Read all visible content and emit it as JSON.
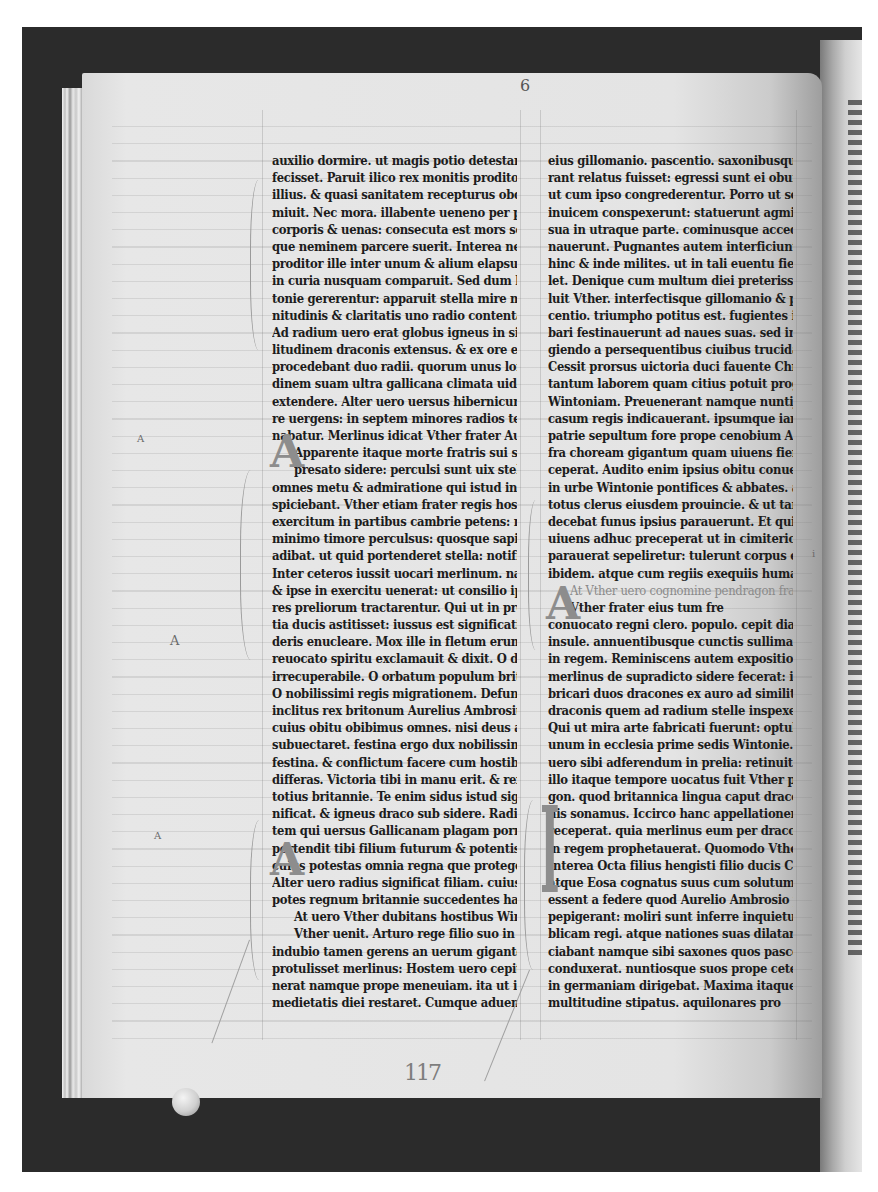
{
  "document": {
    "type": "manuscript-page-photograph",
    "folio_mark": "6",
    "pencil_foliation": "117",
    "colors": {
      "frame": "#2b2b2b",
      "parchment": "#e4e4e4",
      "ink": "#1c1c1c",
      "rubric": "#8a8a8a"
    }
  },
  "left_column": {
    "lines": [
      "auxilio dormire. ut magis potio detestanda pro",
      "fecisset. Paruit ilico rex monitis proditoris",
      "illius. & quasi sanitatem recepturus obdor",
      "miuit. Nec mora. illabente ueneno per poros",
      "corporis & uenas: consecuta est mors soporem",
      "que neminem parcere suerit. Interea nefandus",
      "proditor ille inter unum & alium elapsus",
      "in curia nusquam comparuit. Sed dum hec Win",
      "tonie gererentur: apparuit stella mire mag",
      "nitudinis & claritatis uno radio contenta.",
      "Ad radium uero erat globus igneus in simi",
      "litudinem draconis extensus. & ex ore eius",
      "procedebant duo radii. quorum unus longitu",
      "dinem suam ultra gallicana climata uidebatur",
      "extendere. Alter uero uersus hibernicum ma",
      "re uergens: in septem minores radios termi",
      "nabatur. Merlinus idicat  Vther frater Aurelij de",
      "Apparente itaque  morte fratris sui significata",
      "presato sidere: perculsi sunt  uix stellam appa",
      "omnes metu & admiratione qui istud in",
      "spiciebant. Vther etiam frater regis hostilem",
      "exercitum in partibus cambrie petens: non",
      "minimo timore perculsus: quosque sapientes",
      "adibat. ut quid portenderet stella: notificarent.",
      "Inter ceteros iussit uocari merlinum. nam",
      "& ipse in exercitu uenerat: ut consilio ipsius",
      "res preliorum tractarentur. Qui ut in presen",
      "tia ducis astitisset: iussus est significationem si",
      "deris enucleare. Mox ille in fletum erumpens.",
      "reuocato spiritu exclamauit & dixit. O dampnum",
      "irrecuperabile. O orbatum populum britannie.",
      "O nobilissimi regis migrationem. Defunctus est",
      "inclitus rex britonum Aurelius Ambrosius.",
      "cuius obitu obibimus omnes. nisi deus auxilium",
      "subuectaret. festina ergo dux nobilissime Vther",
      "festina. & conflictum facere cum hostibus ne",
      "differas. Victoria tibi in manu erit. & rex eris",
      "totius britannie. Te enim sidus istud sig",
      "nificat. & igneus draco sub sidere. Radius au",
      "tem qui uersus Gallicanam plagam porrigitur.",
      "portendit tibi filium futurum & potentissimum.",
      "cuius potestas omnia regna que proteget habebit.",
      "Alter uero radius significat filiam. cuius filij & ne",
      "potes regnum britannie succedentes habebunt.",
      "At uero Vther dubitans hostibus  Wintoniam",
      "Vther  uenit. Arturo rege filio suo in cessa",
      "indubio tamen gerens an uerum giganteos iam se",
      "protulisset merlinus: Hostem uero cepit gladio. Adue pal",
      "nerat namque prope meneuiam. ita ut iter to",
      "medietatis diei restaret. Cumque aduentus"
    ]
  },
  "right_column": {
    "lines": [
      "eius gillomanio. pascentio. saxonibusque qui ade",
      "rant relatus fuisset: egressi sunt ei obuiam.",
      "ut cum ipso congrederentur. Porro ut sese ad",
      "inuicem conspexerunt: statuerunt agmina",
      "sua in utraque parte. cominusque accedentes pug",
      "nauerunt. Pugnantes autem interficiuntur",
      "hinc & inde milites. ut in tali euentu fieri so",
      "let. Denique cum multum diei preterisset: pia",
      "luit Vther. interfectisque gillomanio & pas",
      "centio. triumpho potitus est. fugientes itaque bar",
      "bari festinauerunt ad naues suas. sed in fu",
      "giendo a persequentibus ciuibus trucidabantur.",
      "Cessit prorsus uictoria duci fauente Christo. qui post",
      "tantum laborem quam citius potuit progressus est",
      "Wintoniam. Preuenerant namque nuntij qui",
      "casum regis indicauerant. ipsumque iam ab epis",
      "patrie sepultum fore prope cenobium Ambrij in",
      "fra choream gigantum quam uiuens fieri pre",
      "ceperat. Audito enim ipsius obitu conuenerunt",
      "in urbe Wintonie pontifices & abbates. atque",
      "totus clerus eiusdem prouincie. & ut tantum regem",
      "decebat funus ipsius parauerunt. Et quia in",
      "uiuens adhuc preceperat ut in cimiterio quod ipse",
      "parauerat sepeliretur: tulerunt corpus eius",
      "ibidem. atque cum regiis exequiis humauerunt.",
      "At Vther uero cognomine pendragon fra",
      "Vther frater eius  tum fre",
      "conuocato regni clero. populo. cepit diadema",
      "insule. annuentibusque cunctis sullimatus est",
      "in regem. Reminiscens autem expositionis quam",
      "merlinus de supradicto sidere fecerat: iussit fa",
      "bricari duos dracones ex auro ad similitudinem",
      "draconis quem ad radium stelle inspexerat.",
      "Qui ut mira arte fabricati fuerunt: optulit",
      "unum in ecclesia prime sedis Wintonie. alterum",
      "uero sibi adferendum in prelia: retinuit. Ab",
      "illo itaque tempore uocatus fuit Vther pendra",
      "gon. quod britannica lingua caput draco",
      "nis sonamus. Iccirco hanc appellationem",
      "receperat. quia merlinus eum per draconem",
      "in regem prophetauerat. Quomodo Vther pendrago",
      "Interea Octa filius hengisti  filio ducis Cornubie",
      "atque Eosa cognatus suus cum solutum filio hengisti",
      "essent a federe quod Aurelio Ambrosio pepigerant",
      "pepigerant: moliri sunt inferre inquietudinem repu",
      "blicam regi. atque nationes suas dilatare. Asso",
      "ciabant namque sibi saxones quos pascentius",
      "conduxerat. nuntiosque suos prope ceteros",
      "in germaniam dirigebat. Maxima itaque",
      "multitudine stipatus. aquilonares pro"
    ]
  },
  "margin_notes": {
    "left": [
      "A",
      "A",
      "A"
    ],
    "right": [
      "i"
    ]
  },
  "initials": {
    "left_first": "A",
    "left_second": "A",
    "right_first": "A",
    "right_second": "I"
  }
}
